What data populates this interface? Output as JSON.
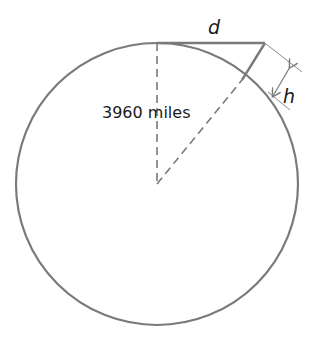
{
  "diagram": {
    "labels": {
      "radius": "3960 miles",
      "distance": "d",
      "height": "h"
    },
    "colors": {
      "stroke": "#7a7a7a",
      "text": "#1a1a1a"
    }
  }
}
